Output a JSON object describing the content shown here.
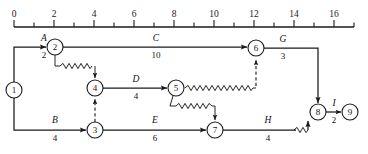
{
  "axis": {
    "name": "time-axis",
    "unit_px": 20,
    "origin_px": 14,
    "y_px": 27,
    "min": 0,
    "max": 17,
    "tick_step": 1,
    "label_step": 2,
    "labels": [
      "0",
      "2",
      "4",
      "6",
      "8",
      "10",
      "12",
      "14",
      "16"
    ],
    "label_values": [
      0,
      2,
      4,
      6,
      8,
      10,
      12,
      14,
      16
    ]
  },
  "nodes": [
    {
      "id": "1",
      "label": "1",
      "x": 14,
      "y": 90,
      "r": 8
    },
    {
      "id": "2",
      "label": "2",
      "x": 55,
      "y": 47,
      "r": 8
    },
    {
      "id": "3",
      "label": "3",
      "x": 95,
      "y": 130,
      "r": 8
    },
    {
      "id": "4",
      "label": "4",
      "x": 95,
      "y": 88,
      "r": 8
    },
    {
      "id": "5",
      "label": "5",
      "x": 176,
      "y": 88,
      "r": 8
    },
    {
      "id": "6",
      "label": "6",
      "x": 256,
      "y": 48,
      "r": 8
    },
    {
      "id": "7",
      "label": "7",
      "x": 215,
      "y": 130,
      "r": 8
    },
    {
      "id": "8",
      "label": "8",
      "x": 318,
      "y": 112,
      "r": 8
    },
    {
      "id": "9",
      "label": "9",
      "x": 350,
      "y": 112,
      "r": 8
    }
  ],
  "activities": [
    {
      "id": "A",
      "name": "A",
      "duration": "2",
      "from": "1",
      "to": "2",
      "start_time": 0,
      "end_time": 2,
      "label_x": 44,
      "name_y": 41,
      "dur_y": 58
    },
    {
      "id": "C",
      "name": "C",
      "duration": "10",
      "from": "2",
      "to": "6",
      "start_time": 2,
      "end_time": 12,
      "label_x": 156,
      "name_y": 41,
      "dur_y": 58
    },
    {
      "id": "G",
      "name": "G",
      "duration": "3",
      "from": "6",
      "to": "8",
      "start_time": 12,
      "end_time": 15,
      "label_x": 283,
      "name_y": 42,
      "dur_y": 59
    },
    {
      "id": "I",
      "name": "I",
      "duration": "2",
      "from": "8",
      "to": "9",
      "start_time": 15,
      "end_time": 16,
      "label_x": 334,
      "name_y": 106,
      "dur_y": 123
    },
    {
      "id": "D",
      "name": "D",
      "duration": "4",
      "from": "4",
      "to": "5",
      "start_time": 4,
      "end_time": 8,
      "label_x": 136,
      "name_y": 82,
      "dur_y": 99
    },
    {
      "id": "B",
      "name": "B",
      "duration": "4",
      "from": "1",
      "to": "3",
      "start_time": 0,
      "end_time": 4,
      "label_x": 55,
      "name_y": 123,
      "dur_y": 141
    },
    {
      "id": "E",
      "name": "E",
      "duration": "6",
      "from": "3",
      "to": "7",
      "start_time": 4,
      "end_time": 10,
      "label_x": 155,
      "name_y": 123,
      "dur_y": 141
    },
    {
      "id": "H",
      "name": "H",
      "duration": "4",
      "from": "7",
      "to": "8",
      "start_time": 10,
      "end_time": 14,
      "label_x": 268,
      "name_y": 123,
      "dur_y": 141
    }
  ],
  "dummy_links": [
    {
      "id": "dummy-3-4",
      "from": "3",
      "to": "4",
      "style": "dashed"
    },
    {
      "id": "dummy-5-6",
      "from": "5",
      "to": "6",
      "style": "dashed"
    }
  ],
  "float_links": [
    {
      "id": "float-2-4",
      "from": "2",
      "to": "4",
      "style": "zigzag"
    },
    {
      "id": "float-5-6",
      "from": "5",
      "to": "6",
      "style": "zigzag"
    },
    {
      "id": "float-5-7",
      "from": "5",
      "to": "7",
      "style": "zigzag"
    },
    {
      "id": "float-h-8",
      "from": "H",
      "to": "8",
      "style": "zigzag"
    }
  ],
  "colors": {
    "ink": "#1a1a1a",
    "paper": "#ffffff"
  }
}
